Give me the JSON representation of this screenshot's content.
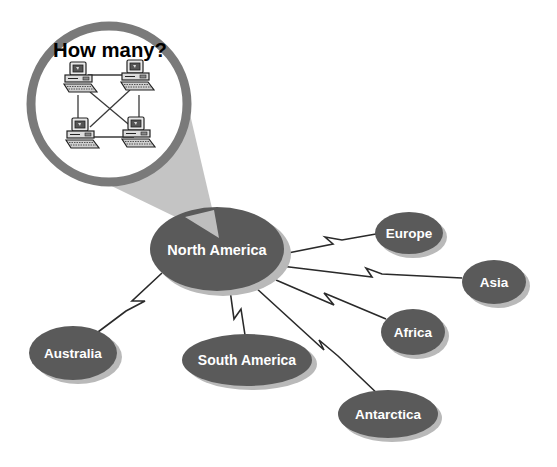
{
  "callout": {
    "title": "How many?",
    "computer_count": 4,
    "icon": "computer-icon"
  },
  "hub": {
    "label": "North America"
  },
  "nodes": [
    {
      "id": "europe",
      "label": "Europe"
    },
    {
      "id": "asia",
      "label": "Asia"
    },
    {
      "id": "africa",
      "label": "Africa"
    },
    {
      "id": "antarctica",
      "label": "Antarctica"
    },
    {
      "id": "south-america",
      "label": "South America"
    },
    {
      "id": "australia",
      "label": "Australia"
    }
  ],
  "colors": {
    "node_fill": "#5a5a5a",
    "node_shadow": "#b9b9b9",
    "ring": "#7a7a7a",
    "cone": "#c4c4c4",
    "connector": "#2a2a2a",
    "background": "#ffffff"
  }
}
